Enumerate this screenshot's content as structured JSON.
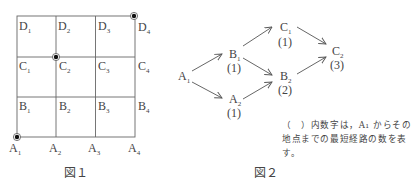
{
  "figure1": {
    "caption": "図１",
    "grid": {
      "cols": 3,
      "rows": 3
    },
    "vertex_labels": {
      "D": [
        "D",
        "D",
        "D",
        "D"
      ],
      "C": [
        "C",
        "C",
        "C",
        "C"
      ],
      "B": [
        "B",
        "B",
        "B",
        "B"
      ],
      "A": [
        "A",
        "A",
        "A",
        "A"
      ]
    },
    "subscripts": [
      "1",
      "2",
      "3",
      "4"
    ],
    "marked_points": [
      "A1",
      "C2",
      "D4"
    ]
  },
  "figure2": {
    "caption": "図２",
    "nodes": [
      {
        "id": "A1",
        "letter": "A",
        "sub": "1",
        "count": ""
      },
      {
        "id": "B1",
        "letter": "B",
        "sub": "1",
        "count": "(1)"
      },
      {
        "id": "A2",
        "letter": "A",
        "sub": "2",
        "count": "(1)"
      },
      {
        "id": "C1",
        "letter": "C",
        "sub": "1",
        "count": "(1)"
      },
      {
        "id": "B2",
        "letter": "B",
        "sub": "2",
        "count": "(2)"
      },
      {
        "id": "C2",
        "letter": "C",
        "sub": "2",
        "count": "(3)"
      }
    ],
    "edges": [
      [
        "A1",
        "B1"
      ],
      [
        "A1",
        "A2"
      ],
      [
        "B1",
        "C1"
      ],
      [
        "B1",
        "B2"
      ],
      [
        "A2",
        "B2"
      ],
      [
        "C1",
        "C2"
      ],
      [
        "B2",
        "C2"
      ]
    ],
    "note": "（　）内数字は，A₁ からその地点までの最短経路の数を表す。"
  }
}
